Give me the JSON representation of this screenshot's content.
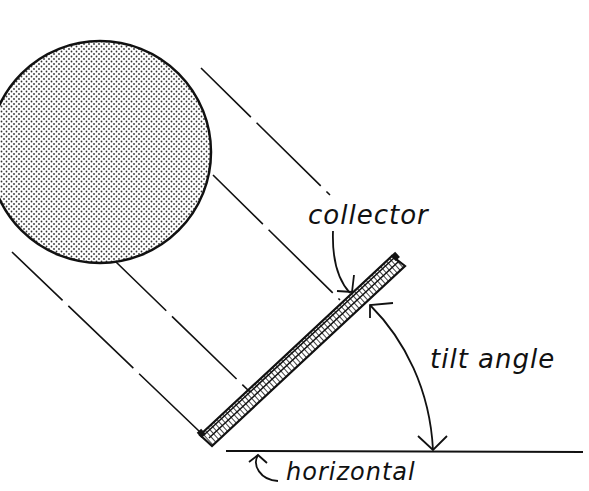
{
  "diagram": {
    "labels": {
      "collector": "collector",
      "tilt_angle": "tilt angle",
      "horizontal": "horizontal"
    },
    "elements": {
      "sun": "stippled circle (sun) at upper left",
      "rays": "four dashed parallel sun-ray lines from sun to collector",
      "collector": "tilted flat-plate collector with glazing strip and hatched body",
      "ground": "horizontal ground line",
      "angle_arc": "double-headed arc between collector and horizontal"
    },
    "colors": {
      "ink": "#111111",
      "background": "#ffffff"
    }
  }
}
